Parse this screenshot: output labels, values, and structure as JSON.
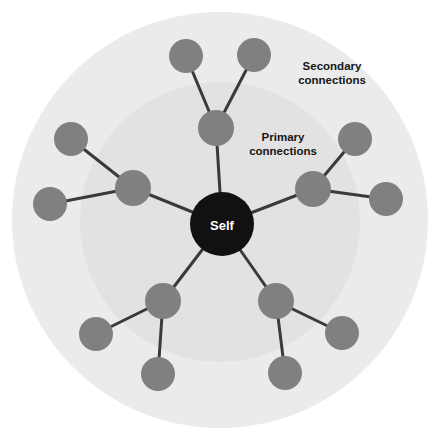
{
  "canvas": {
    "width": 440,
    "height": 444,
    "background": "#ffffff"
  },
  "colors": {
    "outer_zone_fill": "#ebebeb",
    "inner_zone_fill": "#e2e2e2",
    "node_fill": "#808080",
    "center_node_fill": "#111111",
    "edge_stroke": "#3a3a3a",
    "label_text": "#161616",
    "center_label_text": "#ffffff"
  },
  "chart_data": {
    "type": "diagram",
    "title": "",
    "zones": [
      {
        "id": "secondary-zone",
        "label": "Secondary connections",
        "cx": 220,
        "cy": 220,
        "r": 208,
        "fill": "#ebebeb"
      },
      {
        "id": "primary-zone",
        "label": "Primary connections",
        "cx": 220,
        "cy": 222,
        "r": 140,
        "fill": "#e2e2e2"
      }
    ],
    "zone_labels": [
      {
        "id": "secondary-label",
        "text_line_1": "Secondary",
        "text_line_2": "connections",
        "x": 332,
        "y": 70
      },
      {
        "id": "primary-label",
        "text_line_1": "Primary",
        "text_line_2": "connections",
        "x": 283,
        "y": 141
      }
    ],
    "nodes": [
      {
        "id": "self",
        "label": "Self",
        "tier": "center",
        "cx": 222,
        "cy": 224,
        "r": 32,
        "fill": "#111111"
      },
      {
        "id": "p1",
        "label": "",
        "tier": "primary",
        "cx": 216,
        "cy": 128,
        "r": 18,
        "fill": "#808080"
      },
      {
        "id": "p2",
        "label": "",
        "tier": "primary",
        "cx": 313,
        "cy": 189,
        "r": 18,
        "fill": "#808080"
      },
      {
        "id": "p3",
        "label": "",
        "tier": "primary",
        "cx": 276,
        "cy": 301,
        "r": 18,
        "fill": "#808080"
      },
      {
        "id": "p4",
        "label": "",
        "tier": "primary",
        "cx": 163,
        "cy": 301,
        "r": 18,
        "fill": "#808080"
      },
      {
        "id": "p5",
        "label": "",
        "tier": "primary",
        "cx": 133,
        "cy": 188,
        "r": 18,
        "fill": "#808080"
      },
      {
        "id": "s1a",
        "label": "",
        "tier": "secondary",
        "cx": 186,
        "cy": 56,
        "r": 17,
        "fill": "#808080"
      },
      {
        "id": "s1b",
        "label": "",
        "tier": "secondary",
        "cx": 254,
        "cy": 55,
        "r": 17,
        "fill": "#808080"
      },
      {
        "id": "s2a",
        "label": "",
        "tier": "secondary",
        "cx": 355,
        "cy": 139,
        "r": 17,
        "fill": "#808080"
      },
      {
        "id": "s2b",
        "label": "",
        "tier": "secondary",
        "cx": 386,
        "cy": 199,
        "r": 17,
        "fill": "#808080"
      },
      {
        "id": "s3a",
        "label": "",
        "tier": "secondary",
        "cx": 342,
        "cy": 333,
        "r": 17,
        "fill": "#808080"
      },
      {
        "id": "s3b",
        "label": "",
        "tier": "secondary",
        "cx": 285,
        "cy": 373,
        "r": 17,
        "fill": "#808080"
      },
      {
        "id": "s4a",
        "label": "",
        "tier": "secondary",
        "cx": 158,
        "cy": 374,
        "r": 17,
        "fill": "#808080"
      },
      {
        "id": "s4b",
        "label": "",
        "tier": "secondary",
        "cx": 96,
        "cy": 334,
        "r": 17,
        "fill": "#808080"
      },
      {
        "id": "s5a",
        "label": "",
        "tier": "secondary",
        "cx": 71,
        "cy": 139,
        "r": 17,
        "fill": "#808080"
      },
      {
        "id": "s5b",
        "label": "",
        "tier": "secondary",
        "cx": 50,
        "cy": 204,
        "r": 17,
        "fill": "#808080"
      }
    ],
    "edges": [
      {
        "from": "self",
        "to": "p1",
        "x1": 222,
        "y1": 224,
        "x2": 216,
        "y2": 128
      },
      {
        "from": "self",
        "to": "p2",
        "x1": 222,
        "y1": 224,
        "x2": 313,
        "y2": 189
      },
      {
        "from": "self",
        "to": "p3",
        "x1": 222,
        "y1": 224,
        "x2": 276,
        "y2": 301
      },
      {
        "from": "self",
        "to": "p4",
        "x1": 222,
        "y1": 224,
        "x2": 163,
        "y2": 301
      },
      {
        "from": "self",
        "to": "p5",
        "x1": 222,
        "y1": 224,
        "x2": 133,
        "y2": 188
      },
      {
        "from": "p1",
        "to": "s1a",
        "x1": 216,
        "y1": 128,
        "x2": 186,
        "y2": 56
      },
      {
        "from": "p1",
        "to": "s1b",
        "x1": 216,
        "y1": 128,
        "x2": 254,
        "y2": 55
      },
      {
        "from": "p2",
        "to": "s2a",
        "x1": 313,
        "y1": 189,
        "x2": 355,
        "y2": 139
      },
      {
        "from": "p2",
        "to": "s2b",
        "x1": 313,
        "y1": 189,
        "x2": 386,
        "y2": 199
      },
      {
        "from": "p3",
        "to": "s3a",
        "x1": 276,
        "y1": 301,
        "x2": 342,
        "y2": 333
      },
      {
        "from": "p3",
        "to": "s3b",
        "x1": 276,
        "y1": 301,
        "x2": 285,
        "y2": 373
      },
      {
        "from": "p4",
        "to": "s4a",
        "x1": 163,
        "y1": 301,
        "x2": 158,
        "y2": 374
      },
      {
        "from": "p4",
        "to": "s4b",
        "x1": 163,
        "y1": 301,
        "x2": 96,
        "y2": 334
      },
      {
        "from": "p5",
        "to": "s5a",
        "x1": 133,
        "y1": 188,
        "x2": 71,
        "y2": 139
      },
      {
        "from": "p5",
        "to": "s5b",
        "x1": 133,
        "y1": 188,
        "x2": 50,
        "y2": 204
      }
    ],
    "edge_stroke_width": 3
  }
}
